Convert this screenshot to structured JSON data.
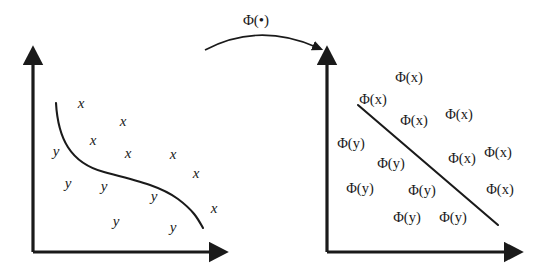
{
  "figure": {
    "background_color": "#ffffff",
    "ink_color": "#1a1a1a",
    "width": 539,
    "height": 272
  },
  "mapping_arrow": {
    "label": "Φ(•)",
    "label_x": 256,
    "label_y": 20,
    "path": "M 205,50 Q 258,22 316,47",
    "arrowhead_name": "arrowhead-right"
  },
  "left_panel": {
    "name": "input-space-plot",
    "axes": {
      "origin_x": 33,
      "origin_y": 252,
      "y_axis_top": 50,
      "x_axis_right": 226
    },
    "boundary": {
      "type": "nonlinear-s-curve",
      "path": "M 56,103 C 58,138 70,163 104,172 C 138,181 160,186 178,199 C 194,211 198,219 203,228"
    },
    "labels": [
      {
        "text": "x",
        "cls": "x",
        "x": 81,
        "y": 103
      },
      {
        "text": "x",
        "cls": "x",
        "x": 123,
        "y": 121
      },
      {
        "text": "x",
        "cls": "x",
        "x": 93,
        "y": 140
      },
      {
        "text": "y",
        "cls": "y",
        "x": 56,
        "y": 151
      },
      {
        "text": "x",
        "cls": "x",
        "x": 128,
        "y": 153
      },
      {
        "text": "x",
        "cls": "x",
        "x": 173,
        "y": 154
      },
      {
        "text": "x",
        "cls": "x",
        "x": 196,
        "y": 173
      },
      {
        "text": "y",
        "cls": "y",
        "x": 68,
        "y": 183
      },
      {
        "text": "y",
        "cls": "y",
        "x": 104,
        "y": 186
      },
      {
        "text": "y",
        "cls": "y",
        "x": 154,
        "y": 196
      },
      {
        "text": "x",
        "cls": "x",
        "x": 214,
        "y": 208
      },
      {
        "text": "y",
        "cls": "y",
        "x": 116,
        "y": 221
      },
      {
        "text": "y",
        "cls": "y",
        "x": 173,
        "y": 227
      }
    ]
  },
  "right_panel": {
    "name": "feature-space-plot",
    "axes": {
      "origin_x": 327,
      "origin_y": 252,
      "y_axis_top": 50,
      "x_axis_right": 521
    },
    "boundary": {
      "type": "linear-separating-hyperplane",
      "x1": 358,
      "y1": 105,
      "x2": 498,
      "y2": 225
    },
    "labels": [
      {
        "text": "Φ(x)",
        "cls": "phix",
        "x": 409,
        "y": 77
      },
      {
        "text": "Φ(x)",
        "cls": "phix",
        "x": 373,
        "y": 99
      },
      {
        "text": "Φ(x)",
        "cls": "phix",
        "x": 414,
        "y": 120
      },
      {
        "text": "Φ(x)",
        "cls": "phix",
        "x": 459,
        "y": 114
      },
      {
        "text": "Φ(y)",
        "cls": "phiy",
        "x": 351,
        "y": 143
      },
      {
        "text": "Φ(y)",
        "cls": "phiy",
        "x": 391,
        "y": 163
      },
      {
        "text": "Φ(x)",
        "cls": "phix",
        "x": 462,
        "y": 158
      },
      {
        "text": "Φ(x)",
        "cls": "phix",
        "x": 498,
        "y": 152
      },
      {
        "text": "Φ(y)",
        "cls": "phiy",
        "x": 360,
        "y": 188
      },
      {
        "text": "Φ(y)",
        "cls": "phiy",
        "x": 422,
        "y": 190
      },
      {
        "text": "Φ(x)",
        "cls": "phix",
        "x": 500,
        "y": 189
      },
      {
        "text": "Φ(y)",
        "cls": "phiy",
        "x": 407,
        "y": 217
      },
      {
        "text": "Φ(y)",
        "cls": "phiy",
        "x": 453,
        "y": 217
      }
    ]
  }
}
